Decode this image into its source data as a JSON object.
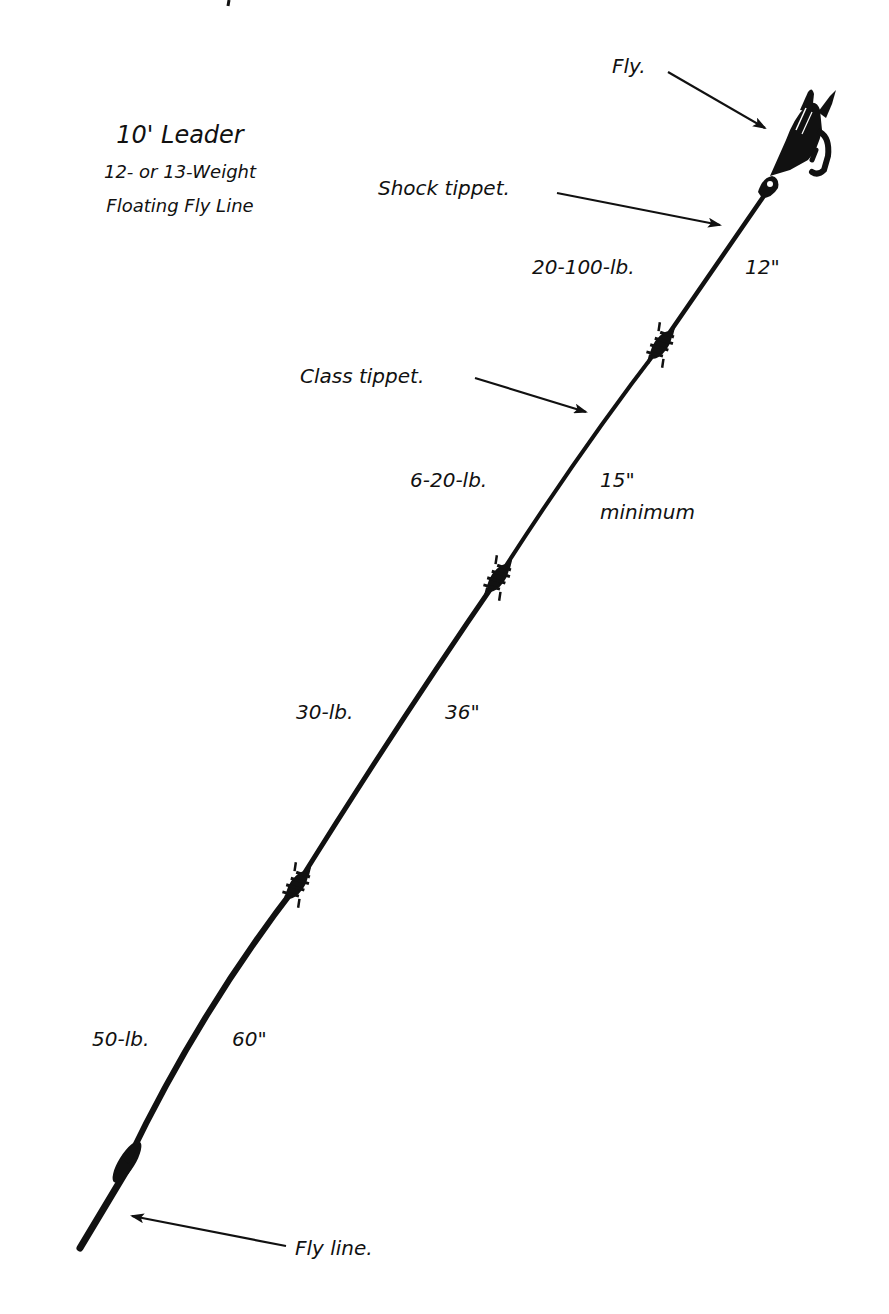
{
  "title": {
    "main": "10' Leader",
    "line_weight": "12- or 13-Weight",
    "line_type": "Floating Fly Line"
  },
  "callouts": {
    "fly": "Fly.",
    "shock_tippet": "Shock tippet.",
    "class_tippet": "Class tippet.",
    "fly_line": "Fly line."
  },
  "sections": [
    {
      "name": "Shock tippet",
      "strength": "20-100-lb.",
      "length": "12\""
    },
    {
      "name": "Class tippet",
      "strength": "6-20-lb.",
      "length": "15\"",
      "length_note": "minimum"
    },
    {
      "name": "Butt section middle",
      "strength": "30-lb.",
      "length": "36\""
    },
    {
      "name": "Butt section",
      "strength": "50-lb.",
      "length": "60\""
    }
  ],
  "colors": {
    "ink": "#111111",
    "background": "#ffffff"
  }
}
